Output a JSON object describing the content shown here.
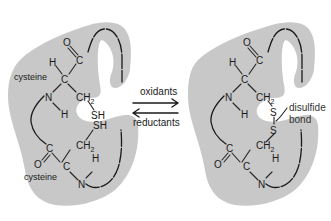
{
  "diagram": {
    "colors": {
      "protein_region": "#c8c8c8",
      "ink": "#1a1a1a",
      "background": "#ffffff"
    },
    "left_state": {
      "residue_top_label": "cysteine",
      "residue_bottom_label": "cysteine",
      "atoms": {
        "top": {
          "O": "O",
          "C_carbonyl": "C",
          "H_alpha": "H",
          "C_alpha": "C",
          "N": "N",
          "H_amide": "H",
          "CH": "CH",
          "CH_sub": "2",
          "SH": "SH"
        },
        "bottom": {
          "SH": "SH",
          "CH": "CH",
          "CH_sub": "2",
          "C_carbonyl": "C",
          "O": "O",
          "C_alpha": "C",
          "H_amide": "H",
          "N": "N"
        }
      }
    },
    "right_state": {
      "atoms": {
        "top": {
          "O": "O",
          "C_carbonyl": "C",
          "H_alpha": "H",
          "C_alpha": "C",
          "N": "N",
          "H_amide": "H",
          "CH": "CH",
          "CH_sub": "2",
          "S": "S"
        },
        "bottom": {
          "S": "S",
          "CH": "CH",
          "CH_sub": "2",
          "C_carbonyl": "C",
          "O": "O",
          "C_alpha": "C",
          "H_amide": "H",
          "N": "N"
        }
      },
      "annotation_line1": "disulfide",
      "annotation_line2": "bond"
    },
    "reaction": {
      "forward_label": "oxidants",
      "reverse_label": "reductants",
      "forward_arrow_icon": "right-arrow",
      "reverse_arrow_icon": "left-arrow"
    }
  }
}
